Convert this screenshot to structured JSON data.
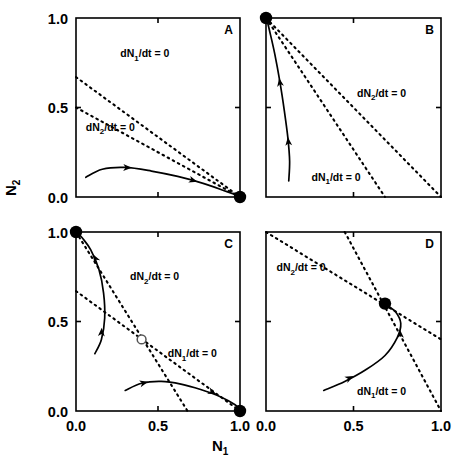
{
  "figure": {
    "axis_labels": {
      "x": "N",
      "x_sub": "1",
      "y": "N",
      "y_sub": "2"
    },
    "tick_labels_x": [
      "0.0",
      "0.5",
      "1.0"
    ],
    "tick_labels_y": [
      "0.0",
      "0.5",
      "1.0"
    ],
    "tick_values": [
      0.0,
      0.5,
      1.0
    ],
    "colors": {
      "ink": "#000000",
      "background": "#ffffff"
    },
    "panels": [
      {
        "id": "A",
        "letter": "A",
        "nullcline1_label": "dN",
        "nullcline1_sub": "1",
        "nullcline1_rest": "/dt = 0",
        "nullcline2_label": "dN",
        "nullcline2_sub": "2",
        "nullcline2_rest": "/dt = 0"
      },
      {
        "id": "B",
        "letter": "B",
        "nullcline1_label": "dN",
        "nullcline1_sub": "1",
        "nullcline1_rest": "/dt = 0",
        "nullcline2_label": "dN",
        "nullcline2_sub": "2",
        "nullcline2_rest": "/dt = 0"
      },
      {
        "id": "C",
        "letter": "C",
        "nullcline1_label": "dN",
        "nullcline1_sub": "1",
        "nullcline1_rest": "/dt = 0",
        "nullcline2_label": "dN",
        "nullcline2_sub": "2",
        "nullcline2_rest": "/dt = 0"
      },
      {
        "id": "D",
        "letter": "D",
        "nullcline1_label": "dN",
        "nullcline1_sub": "1",
        "nullcline1_rest": "/dt = 0",
        "nullcline2_label": "dN",
        "nullcline2_sub": "2",
        "nullcline2_rest": "/dt = 0"
      }
    ]
  },
  "chart_data": {
    "type": "line",
    "title": "",
    "xlabel": "N1",
    "ylabel": "N2",
    "xlim": [
      0.0,
      1.0
    ],
    "ylim": [
      0.0,
      1.0
    ],
    "xticks": [
      0.0,
      0.5,
      1.0
    ],
    "yticks": [
      0.0,
      0.5,
      1.0
    ],
    "grid": false,
    "legend": "none",
    "panels": [
      {
        "label": "A",
        "description": "Species 1 wins: dN1/dt = 0 nullcline lies entirely above dN2/dt = 0 nullcline",
        "nullclines": [
          {
            "name": "dN1/dt = 0",
            "style": "dashed",
            "x": [
              0.0,
              1.0
            ],
            "y": [
              0.67,
              0.0
            ],
            "label_pos": {
              "x": 0.27,
              "y": 0.78
            }
          },
          {
            "name": "dN2/dt = 0",
            "style": "dashed",
            "x": [
              0.0,
              1.0
            ],
            "y": [
              0.5,
              0.0
            ],
            "label_pos": {
              "x": 0.06,
              "y": 0.37
            }
          }
        ],
        "equilibria": [
          {
            "x": 1.0,
            "y": 0.0,
            "type": "stable",
            "marker": "filled-circle"
          }
        ],
        "trajectories": [
          {
            "x": [
              0.06,
              0.16,
              0.3,
              0.46,
              0.62,
              0.78,
              0.92,
              1.0
            ],
            "y": [
              0.11,
              0.155,
              0.165,
              0.145,
              0.115,
              0.075,
              0.03,
              0.005
            ],
            "arrows": [
              {
                "x": 0.34,
                "y": 0.163
              },
              {
                "x": 0.74,
                "y": 0.085
              }
            ]
          }
        ]
      },
      {
        "label": "B",
        "description": "Species 2 wins: dN2/dt = 0 nullcline lies entirely above dN1/dt = 0 nullcline",
        "nullclines": [
          {
            "name": "dN2/dt = 0",
            "style": "dashed",
            "x": [
              0.0,
              1.0
            ],
            "y": [
              1.0,
              0.0
            ],
            "label_pos": {
              "x": 0.52,
              "y": 0.56
            }
          },
          {
            "name": "dN1/dt = 0",
            "style": "dashed",
            "x": [
              0.0,
              0.68
            ],
            "y": [
              1.0,
              0.0
            ],
            "label_pos": {
              "x": 0.26,
              "y": 0.09
            }
          }
        ],
        "equilibria": [
          {
            "x": 0.0,
            "y": 1.0,
            "type": "stable",
            "marker": "filled-circle"
          }
        ],
        "trajectories": [
          {
            "x": [
              0.13,
              0.135,
              0.125,
              0.105,
              0.08,
              0.05,
              0.02,
              0.005
            ],
            "y": [
              0.09,
              0.2,
              0.33,
              0.48,
              0.64,
              0.8,
              0.93,
              0.99
            ],
            "arrows": [
              {
                "x": 0.125,
                "y": 0.335
              },
              {
                "x": 0.075,
                "y": 0.665
              }
            ]
          }
        ]
      },
      {
        "label": "C",
        "description": "Unstable coexistence / priority effect: nullclines cross, interior point is a saddle; two stable single-species equilibria",
        "nullclines": [
          {
            "name": "dN2/dt = 0",
            "style": "dashed",
            "x": [
              0.0,
              0.68
            ],
            "y": [
              1.0,
              0.0
            ],
            "label_pos": {
              "x": 0.33,
              "y": 0.73
            }
          },
          {
            "name": "dN1/dt = 0",
            "style": "dashed",
            "x": [
              0.0,
              1.0
            ],
            "y": [
              0.67,
              0.0
            ],
            "label_pos": {
              "x": 0.56,
              "y": 0.3
            }
          }
        ],
        "equilibria": [
          {
            "x": 0.0,
            "y": 1.0,
            "type": "stable",
            "marker": "filled-circle"
          },
          {
            "x": 1.0,
            "y": 0.0,
            "type": "stable",
            "marker": "filled-circle"
          },
          {
            "x": 0.4,
            "y": 0.4,
            "type": "saddle",
            "marker": "open-circle"
          }
        ],
        "trajectories": [
          {
            "x": [
              0.115,
              0.155,
              0.175,
              0.168,
              0.14,
              0.09,
              0.04,
              0.01
            ],
            "y": [
              0.32,
              0.4,
              0.52,
              0.66,
              0.79,
              0.9,
              0.965,
              0.995
            ],
            "arrows": [
              {
                "x": 0.157,
                "y": 0.465
              },
              {
                "x": 0.105,
                "y": 0.875
              }
            ]
          },
          {
            "x": [
              0.3,
              0.4,
              0.52,
              0.64,
              0.76,
              0.88,
              0.97,
              1.0
            ],
            "y": [
              0.115,
              0.155,
              0.165,
              0.15,
              0.12,
              0.08,
              0.035,
              0.005
            ],
            "arrows": [
              {
                "x": 0.44,
                "y": 0.163
              },
              {
                "x": 0.855,
                "y": 0.095
              }
            ]
          }
        ]
      },
      {
        "label": "D",
        "description": "Stable coexistence: nullclines cross at a globally stable interior equilibrium",
        "nullclines": [
          {
            "name": "dN2/dt = 0",
            "style": "dashed",
            "x": [
              0.0,
              1.0
            ],
            "y": [
              1.0,
              0.4
            ],
            "label_pos": {
              "x": 0.06,
              "y": 0.78
            }
          },
          {
            "name": "dN1/dt = 0",
            "style": "dashed",
            "x": [
              0.45,
              1.0
            ],
            "y": [
              1.0,
              0.0
            ],
            "label_pos": {
              "x": 0.52,
              "y": 0.09
            }
          }
        ],
        "equilibria": [
          {
            "x": 0.68,
            "y": 0.6,
            "type": "stable",
            "marker": "filled-circle"
          }
        ],
        "trajectories": [
          {
            "x": [
              0.33,
              0.45,
              0.57,
              0.68,
              0.75,
              0.77,
              0.74,
              0.69
            ],
            "y": [
              0.115,
              0.165,
              0.23,
              0.31,
              0.41,
              0.49,
              0.555,
              0.59
            ],
            "arrows": [
              {
                "x": 0.5,
                "y": 0.195
              },
              {
                "x": 0.765,
                "y": 0.455
              }
            ]
          }
        ]
      }
    ]
  }
}
